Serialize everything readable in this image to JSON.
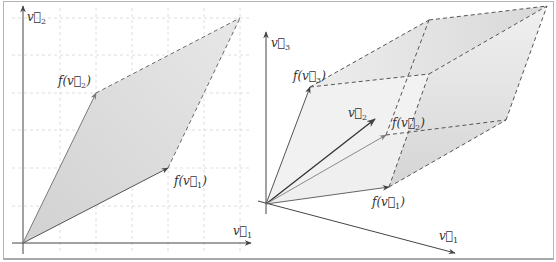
{
  "figure": {
    "left_panel": {
      "title": "2D linear map",
      "axes": {
        "x_label": "v1",
        "y_label": "v2"
      },
      "vector_labels": {
        "f_v1": "f(v1)",
        "f_v2": "f(v2)"
      },
      "grid": {
        "on": true,
        "x_lines": 6,
        "y_lines": 6
      },
      "points": {
        "origin": [
          23,
          243
        ],
        "f_v1": [
          168,
          168
        ],
        "f_v2": [
          96,
          93
        ],
        "f_v1_plus_f_v2": [
          240,
          18
        ]
      }
    },
    "right_panel": {
      "title": "3D linear map",
      "axes": {
        "x_label": "v1",
        "y_label": "v2",
        "z_label": "v3"
      },
      "vector_labels": {
        "f_v1": "f(v1)",
        "f_v2": "f(v2)",
        "f_v3": "f(v3)"
      },
      "points": {
        "origin": [
          266,
          204
        ],
        "axis_v1_end": [
          455,
          253
        ],
        "axis_v3_end": [
          266,
          34
        ],
        "axis_v2_end": [
          375,
          119
        ],
        "f_v1": [
          389,
          187
        ],
        "f_v2": [
          386,
          135
        ],
        "f_v3": [
          310,
          87
        ],
        "f_v1_f_v2": [
          506,
          120
        ],
        "f_v1_f_v3": [
          429,
          74
        ],
        "f_v2_f_v3": [
          429,
          20
        ],
        "f_all": [
          547,
          6
        ]
      }
    },
    "colors": {
      "axis": "#444444",
      "fill": "#d9d9d9",
      "fill_light": "#ececec",
      "dash": "#6a6a6a",
      "grid": "#d0d0d0",
      "image_vector": "#7a7a7a"
    }
  }
}
